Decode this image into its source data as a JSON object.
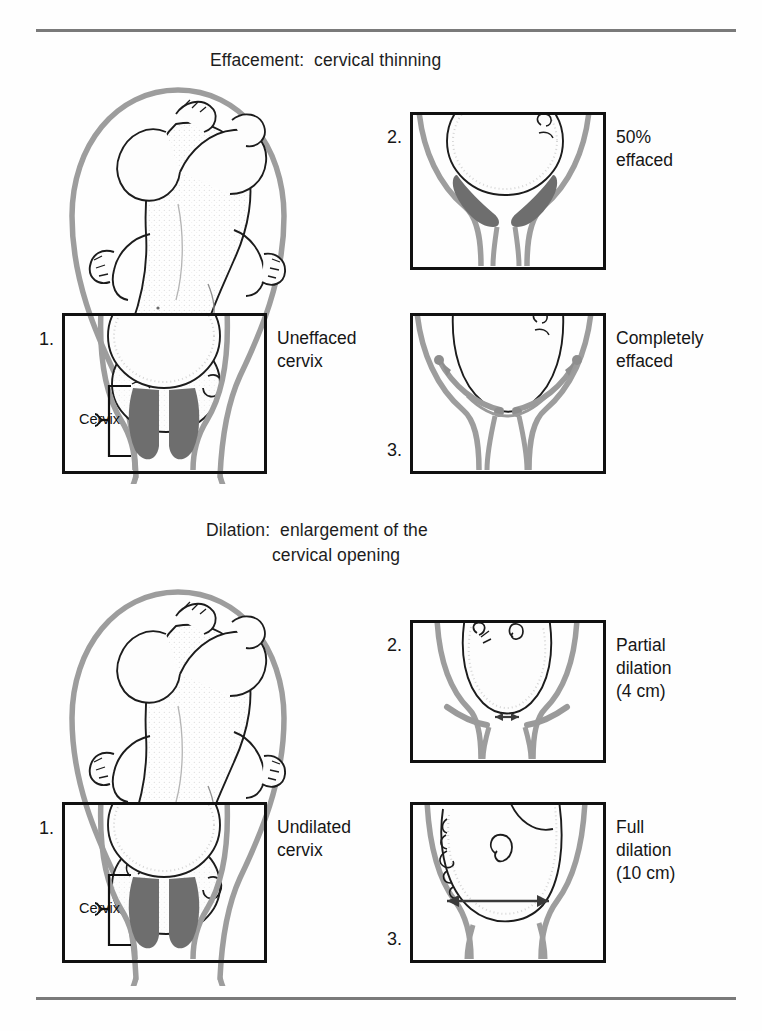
{
  "figure": {
    "sections": [
      {
        "id": "effacement",
        "title": "Effacement:  cervical thinning",
        "panels": [
          {
            "number": "1.",
            "label": "Uneffaced\ncervix",
            "cervix_caption": "Cervix"
          },
          {
            "number": "2.",
            "label": "50%\neffaced"
          },
          {
            "number": "3.",
            "label": "Completely\neffaced"
          }
        ]
      },
      {
        "id": "dilation",
        "title": "Dilation:  enlargement of the\n                cervical opening",
        "title_line1": "Dilation:  enlargement of the",
        "title_line2": "cervical opening",
        "panels": [
          {
            "number": "1.",
            "label": "Undilated\ncervix",
            "cervix_caption": "Cervix"
          },
          {
            "number": "2.",
            "label": "Partial\ndilation\n(4 cm)"
          },
          {
            "number": "3.",
            "label": "Full\ndilation\n(10 cm)"
          }
        ]
      }
    ]
  },
  "colors": {
    "rule": "#7a7a7a",
    "frame": "#111111",
    "uterus_wall": "#9a9a9a",
    "cervix_shade": "#6e6e6e",
    "ink": "#1a1a1a",
    "stipple": "#c9c9c9"
  }
}
